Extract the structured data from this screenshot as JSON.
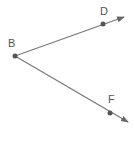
{
  "diagram": {
    "type": "angle",
    "vertex": {
      "label": "B",
      "x": 15,
      "y": 56
    },
    "rays": [
      {
        "name": "BD",
        "point": {
          "label": "D",
          "x": 103,
          "y": 24
        },
        "tip": {
          "x": 124,
          "y": 17
        }
      },
      {
        "name": "BF",
        "point": {
          "label": "F",
          "x": 110,
          "y": 113
        },
        "tip": {
          "x": 128,
          "y": 122
        }
      }
    ],
    "colors": {
      "line": "#666666",
      "point": "#555555",
      "label": "#555555"
    }
  }
}
